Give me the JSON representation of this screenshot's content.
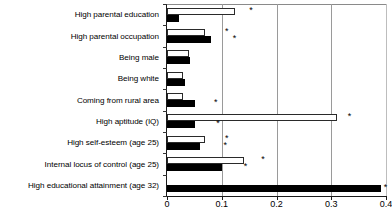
{
  "chart_data": {
    "type": "bar",
    "orientation": "horizontal",
    "title": "",
    "subtitle": "",
    "xlabel": "",
    "ylabel": "",
    "xlim": [
      0,
      0.4
    ],
    "xticks": [
      0,
      0.1,
      0.2,
      0.3,
      0.4
    ],
    "xtick_labels": [
      "0",
      "0.1",
      "0.2",
      "0.3",
      "0.4"
    ],
    "grid": "vertical",
    "legend": "none",
    "categories": [
      "High parental education",
      "High parental occupation",
      "Being male",
      "Being white",
      "Coming from rural area",
      "High aptitude (IQ)",
      "High self-esteem (age 25)",
      "Internal locus of control (age 25)",
      "High educational attainment (age 32)"
    ],
    "series": [
      {
        "name": "white-bar",
        "fill": "#ffffff",
        "values": [
          0.125,
          0.07,
          0.04,
          0.03,
          0.03,
          0.31,
          0.07,
          0.14,
          0.0
        ]
      },
      {
        "name": "black-bar",
        "fill": "#000000",
        "values": [
          0.022,
          0.08,
          0.042,
          0.032,
          0.052,
          0.052,
          0.06,
          0.1,
          0.39
        ]
      }
    ],
    "significance_markers": [
      {
        "category_index": 0,
        "series": "white-bar",
        "x": 0.15,
        "symbol": "*"
      },
      {
        "category_index": 1,
        "series": "white-bar",
        "x": 0.106,
        "symbol": "*"
      },
      {
        "category_index": 1,
        "series": "black-bar",
        "x": 0.12,
        "symbol": "*"
      },
      {
        "category_index": 4,
        "series": "black-bar",
        "x": 0.086,
        "symbol": "*"
      },
      {
        "category_index": 5,
        "series": "white-bar",
        "x": 0.33,
        "symbol": "*"
      },
      {
        "category_index": 5,
        "series": "black-bar",
        "x": 0.09,
        "symbol": "*"
      },
      {
        "category_index": 6,
        "series": "white-bar",
        "x": 0.106,
        "symbol": "*"
      },
      {
        "category_index": 6,
        "series": "black-bar",
        "x": 0.103,
        "symbol": "*"
      },
      {
        "category_index": 7,
        "series": "white-bar",
        "x": 0.172,
        "symbol": "*"
      },
      {
        "category_index": 7,
        "series": "black-bar",
        "x": 0.14,
        "symbol": "*"
      },
      {
        "category_index": 8,
        "series": "black-bar",
        "x": 0.396,
        "symbol": "*"
      }
    ],
    "colors": {
      "axis": "#1a1a1a",
      "gridline": "#9a9a9a",
      "bar_outline": "#2a2a2a",
      "bar_white_fill": "#ffffff",
      "bar_black_fill": "#000000",
      "background": "#ffffff"
    }
  }
}
